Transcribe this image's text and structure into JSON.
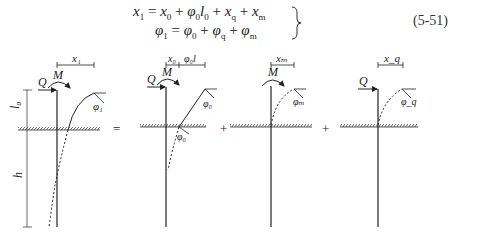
{
  "equations": {
    "line1": {
      "lhs": "x",
      "lhs_sub": "1",
      "eq": " = ",
      "t1": "x",
      "t1_sub": "0",
      "plus1": " + ",
      "t2a": "φ",
      "t2a_sub": "0",
      "t2b": "l",
      "t2b_sub": "0",
      "plus2": " + ",
      "t3": "x",
      "t3_sub": "q",
      "plus3": " + ",
      "t4": "x",
      "t4_sub": "m"
    },
    "line2": {
      "lhs": "φ",
      "lhs_sub": "1",
      "eq": " = ",
      "t1": "φ",
      "t1_sub": "0",
      "plus1": " + ",
      "t2": "φ",
      "t2_sub": "q",
      "plus2": " + ",
      "t3": "φ",
      "t3_sub": "m"
    },
    "number": "(5-51)"
  },
  "diagrams": [
    {
      "id": "total",
      "labels": {
        "disp": "x₁",
        "moment": "M",
        "shear": "Q",
        "rot": "φ₁",
        "free_len": "l₀",
        "embed": "h"
      }
    },
    {
      "id": "initial",
      "labels": {
        "disp_a": "x₀",
        "disp_b": "φ₀l",
        "moment": "M",
        "shear": "Q",
        "rot_top": "φ₀",
        "rot_ground": "φ₀"
      }
    },
    {
      "id": "moment",
      "labels": {
        "disp": "xₘ",
        "moment": "M",
        "rot": "φₘ"
      }
    },
    {
      "id": "shear",
      "labels": {
        "disp": "x_q",
        "shear": "Q",
        "rot": "φ_q"
      }
    }
  ],
  "operators": [
    "=",
    "+",
    "+"
  ],
  "colors": {
    "line": "#222222",
    "hatch": "#333333"
  }
}
